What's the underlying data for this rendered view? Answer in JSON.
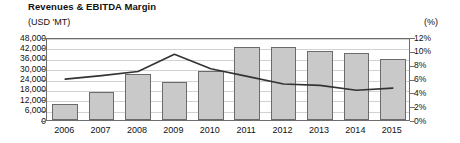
{
  "header": {
    "title": "Revenues & EBITDA Margin",
    "unit_left": "(USD 'MT)",
    "unit_right": "(%)"
  },
  "chart_data": {
    "type": "bar",
    "title": "Revenues & EBITDA Margin",
    "xlabel": "",
    "ylabel": "(USD 'MT)",
    "y2label": "(%)",
    "grid": true,
    "legend": "none",
    "categories": [
      "2006",
      "2007",
      "2008",
      "2009",
      "2010",
      "2011",
      "2012",
      "2013",
      "2014",
      "2015"
    ],
    "ylim": [
      0,
      48000
    ],
    "yticks": [
      "0",
      "6,000",
      "12,000",
      "18,000",
      "24,000",
      "30,000",
      "36,000",
      "42,000",
      "48,000"
    ],
    "ytick_values": [
      0,
      6000,
      12000,
      18000,
      24000,
      30000,
      36000,
      42000,
      48000
    ],
    "y2lim": [
      0,
      12
    ],
    "y2ticks": [
      "0%",
      "2%",
      "4%",
      "6%",
      "8%",
      "10%",
      "12%"
    ],
    "y2tick_values": [
      0,
      2,
      4,
      6,
      8,
      10,
      12
    ],
    "series": [
      {
        "name": "Revenues",
        "type": "bar",
        "axis": "left",
        "color": "#c9c9c9",
        "edge_color": "#6b6b6b",
        "values": [
          9000,
          16000,
          26500,
          22000,
          28500,
          42000,
          42500,
          40000,
          39000,
          35500
        ]
      },
      {
        "name": "EBITDA Margin",
        "type": "line",
        "axis": "right",
        "color": "#333333",
        "values": [
          6.2,
          6.7,
          7.3,
          9.8,
          7.7,
          6.6,
          5.5,
          5.3,
          4.6,
          4.9
        ]
      }
    ]
  }
}
